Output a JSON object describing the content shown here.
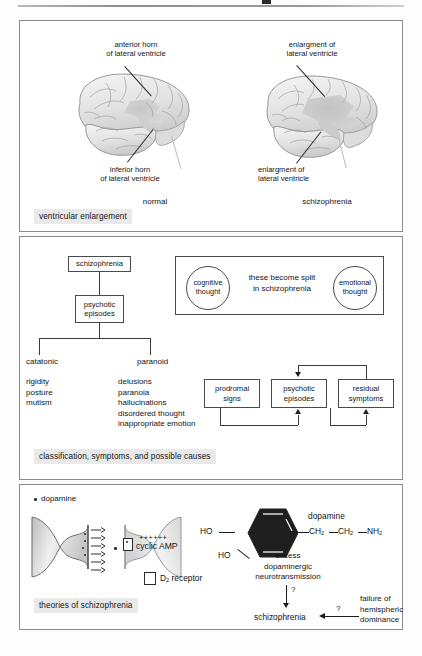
{
  "document": {
    "top_rule_present": true
  },
  "panels": {
    "ventricular": {
      "caption": "ventricular enlargement",
      "left_brain": {
        "condition_label": "normal",
        "annotations": [
          {
            "id": "anterior-horn",
            "text": "anterior horn\nof lateral ventricle"
          },
          {
            "id": "inferior-horn",
            "text": "inferior horn\nof lateral ventricle"
          }
        ]
      },
      "right_brain": {
        "condition_label": "schizophrenia",
        "annotations": [
          {
            "id": "enlargement-upper",
            "text": "enlargment of\nlateral ventricle"
          },
          {
            "id": "enlargement-lower",
            "text": "enlargment of\nlateral ventricle"
          }
        ]
      }
    },
    "classification": {
      "caption": "classification, symptoms, and possible causes",
      "tree": {
        "root": "schizophrenia",
        "child": "psychotic\nepisodes",
        "branches": [
          {
            "type": "catatonic",
            "symptoms": "rigidity\nposture\nmutism"
          },
          {
            "type": "paranoid",
            "symptoms": "delusions\nparanoia\nhallucinations\ndisordered thought\ninappropriate emotion"
          }
        ]
      },
      "split_thought": {
        "left_circle": "cognitive\nthought",
        "center_text": "these become split\nin schizophrenia",
        "right_circle": "emotional\nthought"
      },
      "course_flow": {
        "stages": [
          "prodromal\nsigns",
          "psychotic\nepisodes",
          "residual\nsymptoms"
        ]
      }
    },
    "theories": {
      "caption": "theories  of schizophrenia",
      "synapse": {
        "dopamine_key": "dopamine",
        "cyclic_amp": "cyclic AMP",
        "plus_signs": "++++++",
        "receptor_label_main": "D",
        "receptor_label_sub": "2",
        "receptor_label_tail": " receptor"
      },
      "molecule": {
        "title": "dopamine",
        "hydroxyl_upper": "HO",
        "hydroxyl_lower": "HO",
        "chain": [
          {
            "main": "CH",
            "sub": "2"
          },
          {
            "main": "CH",
            "sub": "2"
          },
          {
            "main": "NH",
            "sub": "2"
          }
        ]
      },
      "causal": {
        "excess": "excess\ndopaminergic\nneurotransmission",
        "question_mark_vertical": "?",
        "question_mark_horizontal": "?",
        "outcome": "schizophrenia",
        "alternative_cause": "failure of\nhemispheric\ndominance"
      }
    }
  },
  "colors": {
    "panel_border": "#8b8b8b",
    "caption_bg": "#e9e9e9",
    "box_border": "#4a4a4a",
    "ink": "#141414",
    "brain_fill": "#e2e2e2",
    "ventricle_fill": "#cfcfcf",
    "molecule_fill": "#1f1f1f"
  }
}
